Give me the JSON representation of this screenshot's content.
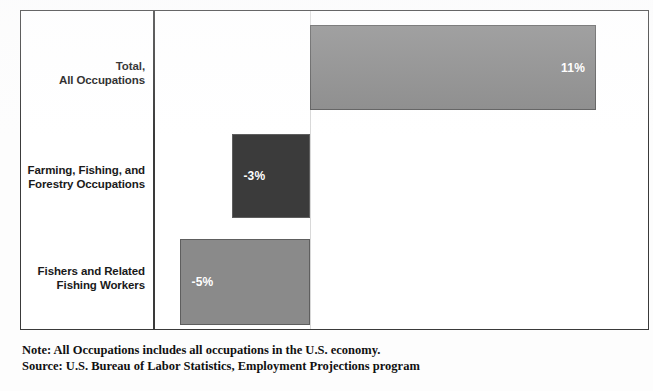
{
  "chart_data": {
    "type": "bar",
    "orientation": "horizontal",
    "title": "",
    "subtitle": "",
    "xlabel": "",
    "ylabel": "",
    "categories": [
      "Total, All Occupations",
      "Farming, Fishing, and Forestry Occupations",
      "Fishers and Related Fishing Workers"
    ],
    "values": [
      11,
      -3,
      -5
    ],
    "value_labels": [
      "11%",
      "-3%",
      "-5%"
    ],
    "xlim": [
      -6,
      13
    ],
    "grid": false,
    "legend": "none",
    "zero_line": 0,
    "units": "percent",
    "bars": [
      {
        "category_line_1": "Total,",
        "category_line_2": "All Occupations",
        "value": 11,
        "value_label": "11%",
        "color": "#8a8a8a",
        "direction": "positive"
      },
      {
        "category_line_1": "Farming, Fishing, and",
        "category_line_2": "Forestry Occupations",
        "value": -3,
        "value_label": "-3%",
        "color": "#3b3b3b",
        "direction": "negative"
      },
      {
        "category_line_1": "Fishers and Related",
        "category_line_2": "Fishing Workers",
        "value": -5,
        "value_label": "-5%",
        "color": "#8a8a8a",
        "direction": "negative"
      }
    ]
  },
  "footnote": {
    "note": "Note: All Occupations includes all occupations in the U.S. economy.",
    "source": "Source: U.S. Bureau of Labor Statistics, Employment Projections program"
  },
  "colors": {
    "bar_light": "#8a8a8a",
    "bar_dark": "#3b3b3b",
    "bar_border": "#5e5e5e",
    "frame": "#3a3a3a",
    "zero_line": "#d8d8d8",
    "text": "#1a1a1a",
    "value_text": "#ffffff",
    "background": "#ffffff"
  }
}
